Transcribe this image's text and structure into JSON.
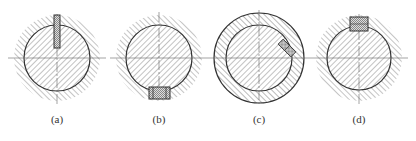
{
  "diagram": {
    "type": "shaft-key cross sections",
    "figures": [
      {
        "id": "a",
        "label": "(a)",
        "cx": 57,
        "cy": 58,
        "inner_r": 33,
        "outer_r": 43,
        "outer_style": "hatched-field",
        "key": {
          "position": "top",
          "type": "narrow-vertical"
        }
      },
      {
        "id": "b",
        "label": "(b)",
        "cx": 159,
        "cy": 58,
        "inner_r": 33,
        "outer_r": 43,
        "outer_style": "hatched-field",
        "key": {
          "position": "bottom",
          "type": "rectangular"
        }
      },
      {
        "id": "c",
        "label": "(c)",
        "cx": 259,
        "cy": 58,
        "inner_r": 33,
        "outer_r": 45,
        "outer_style": "hatched-ring",
        "key": {
          "position": "upper-right",
          "type": "inclined"
        }
      },
      {
        "id": "d",
        "label": "(d)",
        "cx": 359,
        "cy": 58,
        "inner_r": 32,
        "outer_r": 43,
        "outer_style": "hatched-field",
        "key": {
          "position": "top",
          "type": "rectangular"
        }
      }
    ]
  },
  "labels": {
    "a": "(a)",
    "b": "(b)",
    "c": "(c)",
    "d": "(d)"
  },
  "colors": {
    "line": "#333333",
    "hatch": "#555555",
    "key_fill": "#bbbbbb"
  }
}
